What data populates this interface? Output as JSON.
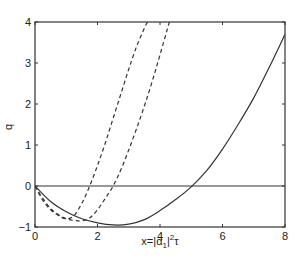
{
  "chart_data": {
    "type": "line",
    "title": "",
    "xlabel": "x=|α1|²τ",
    "xlabel_parts": {
      "prefix": "x=|α",
      "sub": "1",
      "mid": "|",
      "sup": "2",
      "suffix": "τ"
    },
    "ylabel": "q",
    "xlim": [
      0,
      8
    ],
    "ylim": [
      -1,
      4
    ],
    "grid": false,
    "legend": null,
    "x_ticks": [
      0,
      2,
      4,
      6,
      8
    ],
    "y_ticks": [
      -1,
      0,
      1,
      2,
      3,
      4
    ],
    "x_tick_labels": [
      "0",
      "2",
      "4",
      "6",
      "8"
    ],
    "y_tick_labels": [
      "-1",
      "0",
      "1",
      "2",
      "3",
      "4"
    ],
    "reference_line": {
      "y": 0,
      "style": "solid"
    },
    "series": [
      {
        "name": "solid",
        "style": "solid",
        "x": [
          0,
          0.5,
          1,
          1.5,
          2,
          2.5,
          3,
          3.5,
          4,
          4.5,
          5,
          5.5,
          6,
          6.5,
          7,
          7.5,
          8
        ],
        "values": [
          0,
          -0.38,
          -0.63,
          -0.8,
          -0.9,
          -0.95,
          -0.93,
          -0.82,
          -0.6,
          -0.33,
          -0.02,
          0.38,
          0.9,
          1.5,
          2.15,
          2.9,
          3.7
        ]
      },
      {
        "name": "dashed-1",
        "style": "dashed",
        "x": [
          0,
          0.25,
          0.5,
          0.75,
          1,
          1.25,
          1.5,
          1.75,
          2,
          2.25,
          2.5,
          2.75,
          3,
          3.25,
          3.5,
          3.6
        ],
        "values": [
          0,
          -0.35,
          -0.58,
          -0.72,
          -0.8,
          -0.72,
          -0.42,
          0,
          0.5,
          1.05,
          1.65,
          2.25,
          2.85,
          3.4,
          3.85,
          4
        ]
      },
      {
        "name": "dashed-2",
        "style": "dashed",
        "x": [
          0,
          0.25,
          0.5,
          0.75,
          1,
          1.25,
          1.5,
          1.75,
          2,
          2.25,
          2.5,
          2.75,
          3,
          3.25,
          3.5,
          3.75,
          4,
          4.3
        ],
        "values": [
          0,
          -0.3,
          -0.55,
          -0.7,
          -0.8,
          -0.84,
          -0.85,
          -0.78,
          -0.58,
          -0.3,
          0,
          0.4,
          0.88,
          1.4,
          1.95,
          2.55,
          3.2,
          4
        ]
      }
    ]
  }
}
